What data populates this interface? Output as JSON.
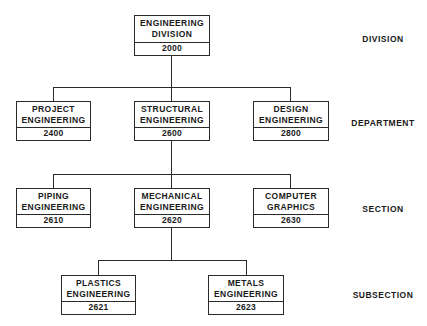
{
  "chart": {
    "levels": [
      "DIVISION",
      "DEPARTMENT",
      "SECTION",
      "SUBSECTION"
    ],
    "nodes": {
      "division": {
        "line1": "ENGINEERING",
        "line2": "DIVISION",
        "code": "2000"
      },
      "project": {
        "line1": "PROJECT",
        "line2": "ENGINEERING",
        "code": "2400"
      },
      "structural": {
        "line1": "STRUCTURAL",
        "line2": "ENGINEERING",
        "code": "2600"
      },
      "design": {
        "line1": "DESIGN",
        "line2": "ENGINEERING",
        "code": "2800"
      },
      "piping": {
        "line1": "PIPING",
        "line2": "ENGINEERING",
        "code": "2610"
      },
      "mechanical": {
        "line1": "MECHANICAL",
        "line2": "ENGINEERING",
        "code": "2620"
      },
      "computer": {
        "line1": "COMPUTER",
        "line2": "GRAPHICS",
        "code": "2630"
      },
      "plastics": {
        "line1": "PLASTICS",
        "line2": "ENGINEERING",
        "code": "2621"
      },
      "metals": {
        "line1": "METALS",
        "line2": "ENGINEERING",
        "code": "2623"
      }
    },
    "edges": [
      [
        "division",
        "project"
      ],
      [
        "division",
        "structural"
      ],
      [
        "division",
        "design"
      ],
      [
        "structural",
        "piping"
      ],
      [
        "structural",
        "mechanical"
      ],
      [
        "structural",
        "computer"
      ],
      [
        "mechanical",
        "plastics"
      ],
      [
        "mechanical",
        "metals"
      ]
    ]
  }
}
